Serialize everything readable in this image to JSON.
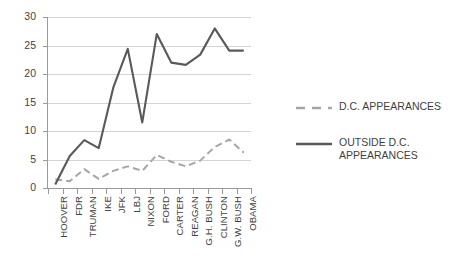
{
  "chart_data": {
    "type": "line",
    "title": "",
    "subtitle": "",
    "xlabel": "",
    "ylabel": "",
    "ylim": [
      0,
      30
    ],
    "ytick_values": [
      0,
      5,
      10,
      15,
      20,
      25,
      30
    ],
    "ytick_labels": [
      "0",
      "5",
      "10",
      "15",
      "20",
      "25",
      "30"
    ],
    "grid": true,
    "legend_position": "right",
    "categories": [
      "HOOVER",
      "FDR",
      "TRUMAN",
      "IKE",
      "JFK",
      "LBJ",
      "NIXON",
      "FORD",
      "CARTER",
      "REAGAN",
      "G.H. BUSH",
      "CLINTON",
      "G.W. BUSH",
      "OBAMA"
    ],
    "series": [
      {
        "name": "D.C. APPEARANCES",
        "legend_label": "D.C. APPEARANCES",
        "style": "dashed",
        "color": "#a6a6a6",
        "values": [
          1.5,
          1.2,
          3.3,
          1.6,
          3.0,
          3.8,
          3.0,
          5.8,
          4.6,
          3.8,
          4.8,
          7.2,
          8.5,
          6.2
        ]
      },
      {
        "name": "OUTSIDE D.C. APPEARANCES",
        "legend_label": "OUTSIDE D.C.\nAPPEARANCES",
        "style": "solid",
        "color": "#595959",
        "values": [
          0.6,
          5.6,
          8.4,
          7.0,
          17.6,
          24.4,
          11.5,
          27.0,
          22.0,
          21.6,
          23.4,
          28.0,
          24.1,
          24.1
        ]
      }
    ]
  },
  "colors": {
    "background": "#ffffff",
    "grid": "#d4d4d4",
    "axis": "#9a9a9a",
    "text": "#3f3f3f",
    "series_dashed": "#a6a6a6",
    "series_solid": "#595959"
  }
}
